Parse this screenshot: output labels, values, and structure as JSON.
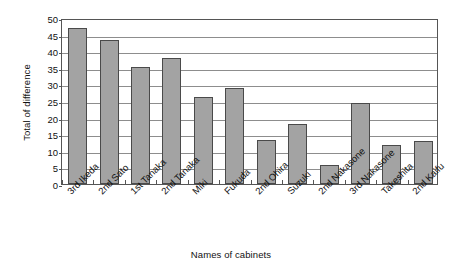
{
  "chart_data": {
    "type": "bar",
    "title": "",
    "xlabel": "Names of cabinets",
    "ylabel": "Total of difference",
    "categories": [
      "3rd Ikeda",
      "2nd Sato",
      "1st Tanaka",
      "2nd Tanaka",
      "Miki",
      "Fukuda",
      "2nd Ohira",
      "Suzuki",
      "2nd Nakasone",
      "3rd Nakasone",
      "Takeshita",
      "2nd Kaifu"
    ],
    "values": [
      47,
      43.3,
      35.2,
      38,
      26.3,
      29,
      13.2,
      18.2,
      5.7,
      24.5,
      11.9,
      13
    ],
    "ylim": [
      0,
      50
    ],
    "yticks": [
      0,
      5,
      10,
      15,
      20,
      25,
      30,
      35,
      40,
      45,
      50
    ],
    "ytick_labels": [
      "0",
      "5",
      "10",
      "15",
      "20",
      "25",
      "30",
      "35",
      "40",
      "45",
      "50"
    ],
    "grid": true,
    "grid_axis": "y",
    "legend": "none",
    "bar_color": "#a3a3a3",
    "bar_edge_color": "#4a4a4a",
    "axis_color": "#555555",
    "grid_color": "#8d8d8d",
    "background_color": "#ffffff"
  }
}
